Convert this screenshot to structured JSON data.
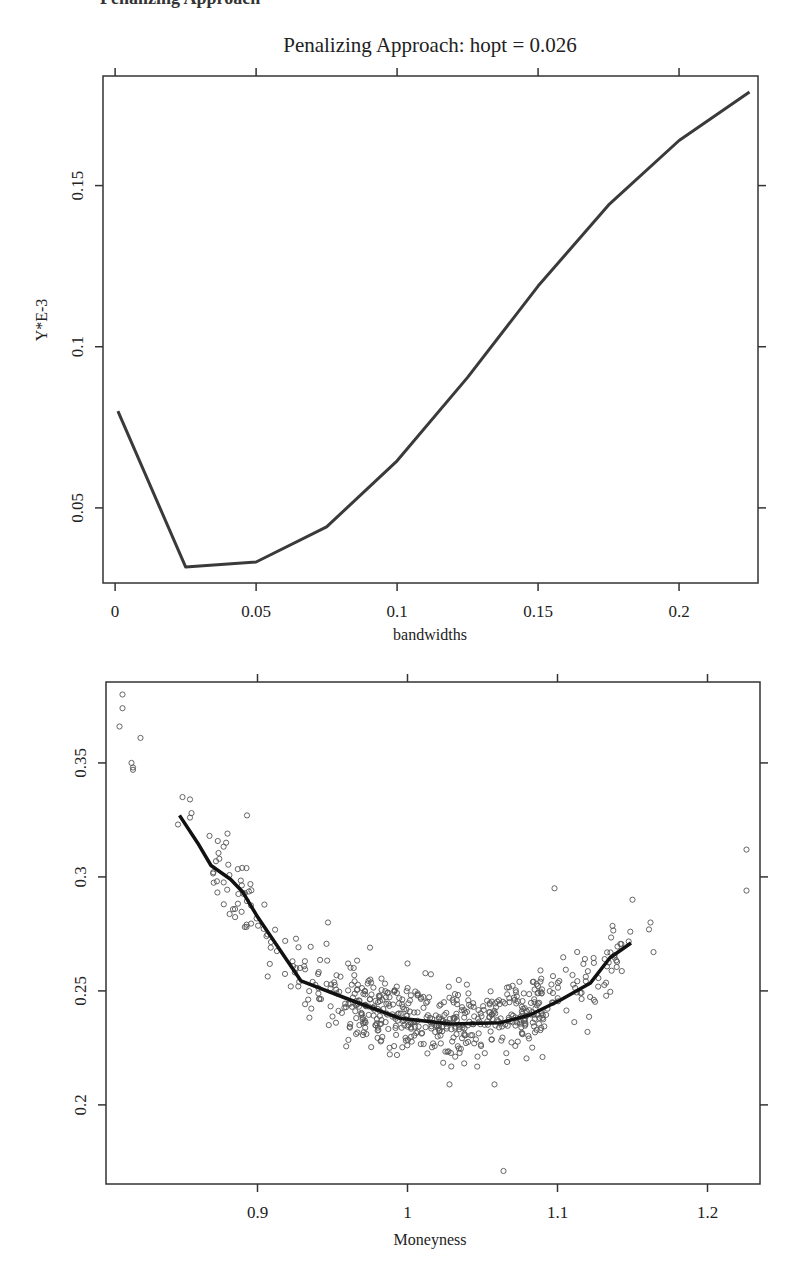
{
  "page": {
    "cutoff_text": "Penalizing Approach"
  },
  "chart_data": [
    {
      "type": "line",
      "title": "Penalizing Approach: hopt = 0.026",
      "xlabel": "bandwidths",
      "ylabel": "Y*E-3",
      "x": [
        0.001,
        0.025,
        0.05,
        0.075,
        0.1,
        0.125,
        0.15,
        0.175,
        0.2,
        0.225
      ],
      "values": [
        0.08,
        0.0317,
        0.0332,
        0.0441,
        0.0646,
        0.0905,
        0.1188,
        0.144,
        0.164,
        0.179
      ],
      "xticks": [
        0,
        0.05,
        0.1,
        0.15,
        0.2
      ],
      "xtick_labels": [
        "0",
        "0.05",
        "0.1",
        "0.15",
        "0.2"
      ],
      "yticks": [
        0.05,
        0.1,
        0.15
      ],
      "ytick_labels": [
        "0.05",
        "0.1",
        "0.15"
      ],
      "xlim": [
        -0.0043,
        0.228
      ],
      "ylim": [
        0.0267,
        0.184
      ],
      "grid": false,
      "line_color": "#3a3a3a",
      "hopt": 0.026
    },
    {
      "type": "scatter",
      "title": "",
      "xlabel": "Moneyness",
      "ylabel": "",
      "xticks": [
        0.9,
        1.0,
        1.1,
        1.2
      ],
      "xtick_labels": [
        "0.9",
        "1",
        "1.1",
        "1.2"
      ],
      "yticks": [
        0.2,
        0.25,
        0.3,
        0.35
      ],
      "ytick_labels": [
        "0.2",
        "0.25",
        "0.3",
        "0.35"
      ],
      "xlim": [
        0.799,
        1.235
      ],
      "ylim": [
        0.1653,
        0.3855
      ],
      "grid": false,
      "point_color": "#555555",
      "smoother_color": "#111111",
      "outliers": [
        {
          "x": 0.81,
          "y": 0.38
        },
        {
          "x": 0.81,
          "y": 0.374
        },
        {
          "x": 0.808,
          "y": 0.366
        },
        {
          "x": 0.822,
          "y": 0.361
        },
        {
          "x": 0.816,
          "y": 0.35
        },
        {
          "x": 0.817,
          "y": 0.348
        },
        {
          "x": 0.817,
          "y": 0.347
        },
        {
          "x": 0.85,
          "y": 0.335
        },
        {
          "x": 0.855,
          "y": 0.334
        },
        {
          "x": 0.856,
          "y": 0.328
        },
        {
          "x": 0.847,
          "y": 0.323
        },
        {
          "x": 0.868,
          "y": 0.318
        },
        {
          "x": 0.88,
          "y": 0.319
        },
        {
          "x": 0.893,
          "y": 0.327
        },
        {
          "x": 0.855,
          "y": 0.326
        },
        {
          "x": 0.947,
          "y": 0.28
        },
        {
          "x": 0.975,
          "y": 0.269
        },
        {
          "x": 1.0,
          "y": 0.262
        },
        {
          "x": 1.098,
          "y": 0.295
        },
        {
          "x": 1.15,
          "y": 0.29
        },
        {
          "x": 1.162,
          "y": 0.28
        },
        {
          "x": 1.161,
          "y": 0.277
        },
        {
          "x": 1.164,
          "y": 0.267
        },
        {
          "x": 1.226,
          "y": 0.312
        },
        {
          "x": 1.226,
          "y": 0.294
        },
        {
          "x": 1.064,
          "y": 0.171
        },
        {
          "x": 1.028,
          "y": 0.209
        },
        {
          "x": 1.058,
          "y": 0.209
        },
        {
          "x": 1.09,
          "y": 0.221
        },
        {
          "x": 1.12,
          "y": 0.232
        }
      ],
      "cluster": {
        "count": 620,
        "x_range": [
          0.87,
          1.15
        ],
        "noise_sd": 0.0085
      },
      "smoother": {
        "x": [
          0.848,
          0.86,
          0.869,
          0.882,
          0.89,
          0.9,
          0.929,
          0.962,
          0.995,
          1.029,
          1.062,
          1.082,
          1.102,
          1.122,
          1.135,
          1.149
        ],
        "y": [
          0.327,
          0.315,
          0.305,
          0.299,
          0.2935,
          0.2825,
          0.2544,
          0.246,
          0.238,
          0.2355,
          0.236,
          0.2395,
          0.246,
          0.2535,
          0.2645,
          0.271
        ]
      }
    }
  ]
}
